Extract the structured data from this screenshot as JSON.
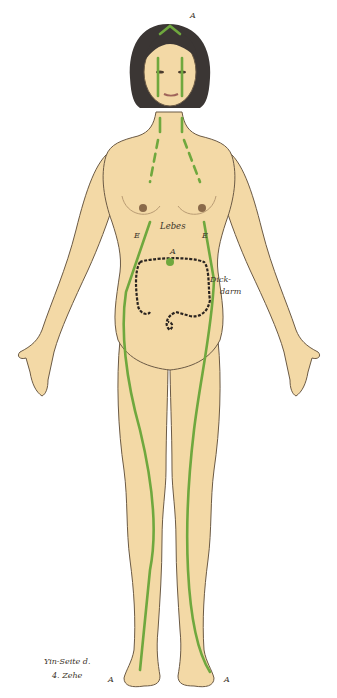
{
  "figure": {
    "meridian_color": "#6fa83e",
    "skin_color": "#f3d9a6",
    "outline_color": "#6b5a45",
    "hair_color": "#3b3634",
    "colon_color": "#2a2420"
  },
  "labels": {
    "head_point": "A",
    "stomach": "Lebes",
    "left_E": "E",
    "right_E": "E",
    "navel_point": "A",
    "colon_line1": "Dick-",
    "colon_line2": "darm",
    "caption_line1": "Yin-Seite d.",
    "caption_line2": "4. Zehe",
    "left_toe_point": "A",
    "right_toe_point": "A"
  }
}
